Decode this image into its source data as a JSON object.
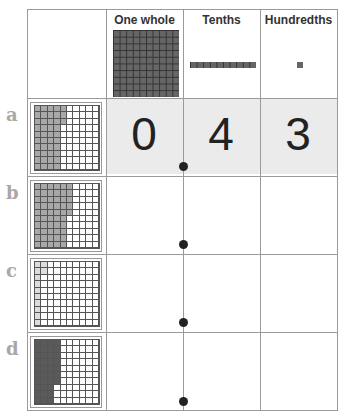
{
  "headers": {
    "col1": "",
    "col2": "One whole",
    "col3": "Tenths",
    "col4": "Hundredths"
  },
  "rows": [
    {
      "label": "a",
      "shaded_hundredths": 43,
      "shade": "medium",
      "digits": [
        "0",
        "4",
        "3"
      ]
    },
    {
      "label": "b",
      "shaded_hundredths": 55,
      "shade": "medium",
      "digits": [
        "",
        "",
        ""
      ]
    },
    {
      "label": "c",
      "shaded_hundredths": 12,
      "shade": "light",
      "digits": [
        "",
        "",
        ""
      ]
    },
    {
      "label": "d",
      "shaded_hundredths": 37,
      "shade": "dark",
      "digits": [
        "",
        "",
        ""
      ]
    }
  ],
  "decimal_point": "•",
  "colors": {
    "border": "#9a9a9a",
    "row_a_fill": "#ebebeb",
    "label": "#a8a8a8",
    "block": "#666666"
  }
}
